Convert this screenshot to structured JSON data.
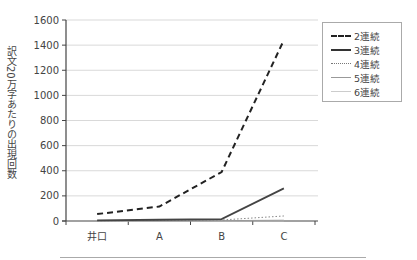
{
  "chart_data": {
    "type": "line",
    "title": "",
    "xlabel": "",
    "ylabel": "訳文20万字あたりの出現回数",
    "categories": [
      "井口",
      "A",
      "B",
      "C"
    ],
    "ylim": [
      0,
      1600
    ],
    "yticks": [
      0,
      200,
      400,
      600,
      800,
      1000,
      1200,
      1400,
      1600
    ],
    "grid": true,
    "legend_position": "right",
    "series": [
      {
        "name": "2連続",
        "style": "dashed",
        "color": "#222222",
        "values": [
          55,
          115,
          390,
          1440
        ]
      },
      {
        "name": "3連続",
        "style": "solid",
        "color": "#444444",
        "values": [
          5,
          10,
          15,
          260
        ]
      },
      {
        "name": "4連続",
        "style": "dotted",
        "color": "#888888",
        "values": [
          2,
          5,
          8,
          40
        ]
      },
      {
        "name": "5連続",
        "style": "solid",
        "color": "#999999",
        "values": [
          1,
          2,
          3,
          6
        ]
      },
      {
        "name": "6連続",
        "style": "solid",
        "color": "#cccccc",
        "values": [
          0,
          1,
          1,
          2
        ]
      }
    ]
  },
  "axis": {
    "ylabel": "訳文20万字あたりの出現回数",
    "yticks": [
      "0",
      "200",
      "400",
      "600",
      "800",
      "1000",
      "1200",
      "1400",
      "1600"
    ],
    "categories": [
      "井口",
      "A",
      "B",
      "C"
    ]
  },
  "legend": {
    "items": [
      {
        "label": "2連続"
      },
      {
        "label": "3連続"
      },
      {
        "label": "4連続"
      },
      {
        "label": "5連続"
      },
      {
        "label": "6連続"
      }
    ]
  }
}
